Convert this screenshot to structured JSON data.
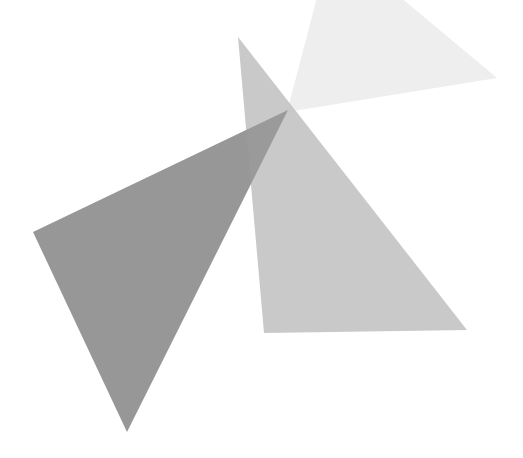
{
  "canvas": {
    "width": 523,
    "height": 458,
    "background_color": "#ffffff",
    "title": "Overlapping Translucent Triangles"
  },
  "chart_data": {
    "type": "scatter",
    "title": "",
    "xlabel": "",
    "ylabel": "",
    "xlim": [
      0,
      523
    ],
    "ylim": [
      0,
      458
    ],
    "grid": false,
    "legend": "none",
    "series": [
      {
        "name": "triangle-dark",
        "shape": "triangle",
        "points": [
          [
            33,
            232
          ],
          [
            127,
            432
          ],
          [
            288,
            110
          ]
        ],
        "fill": "#6f6f6f",
        "opacity": 0.72,
        "blended_color": "#8a8a8a"
      },
      {
        "name": "triangle-medium",
        "shape": "triangle",
        "points": [
          [
            238,
            37
          ],
          [
            264,
            333
          ],
          [
            467,
            330
          ]
        ],
        "fill": "#9c9c9c",
        "opacity": 0.55,
        "blended_color": "#b8b8b8"
      },
      {
        "name": "triangle-light",
        "shape": "triangle",
        "points": [
          [
            287,
            112
          ],
          [
            332,
            -60
          ],
          [
            497,
            78
          ]
        ],
        "fill": "#c8c8c8",
        "opacity": 0.3,
        "blended_color": "#eaeaea"
      }
    ],
    "palette": {
      "dark": "#8a8a8a",
      "medium": "#b8b8b8",
      "light": "#eaeaea",
      "overlap_darkest": "#767676",
      "background": "#ffffff"
    }
  }
}
